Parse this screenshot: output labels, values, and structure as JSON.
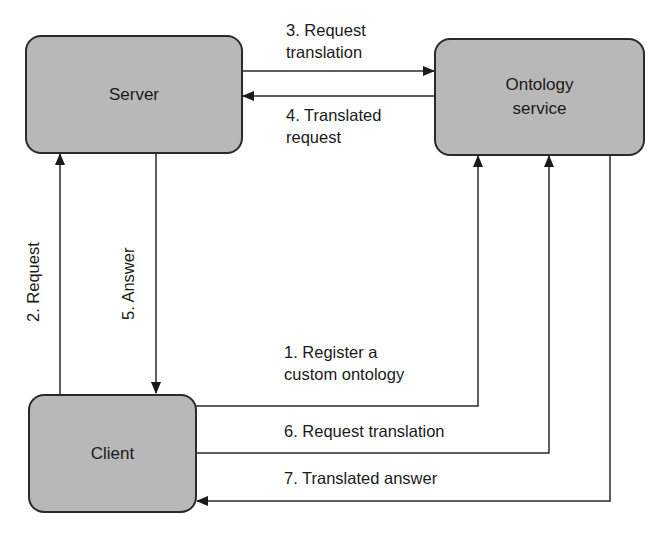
{
  "diagram": {
    "nodes": {
      "server": {
        "label": "Server"
      },
      "ontology": {
        "label_line1": "Ontology",
        "label_line2": "service"
      },
      "client": {
        "label": "Client"
      }
    },
    "edges": [
      {
        "id": "e1",
        "from": "client",
        "to": "ontology",
        "label_line1": "1. Register a",
        "label_line2": "custom ontology"
      },
      {
        "id": "e2",
        "from": "client",
        "to": "server",
        "label": "2. Request"
      },
      {
        "id": "e3",
        "from": "server",
        "to": "ontology",
        "label_line1": "3. Request",
        "label_line2": "translation"
      },
      {
        "id": "e4",
        "from": "ontology",
        "to": "server",
        "label_line1": "4. Translated",
        "label_line2": "request"
      },
      {
        "id": "e5",
        "from": "server",
        "to": "client",
        "label": "5. Answer"
      },
      {
        "id": "e6",
        "from": "client",
        "to": "ontology",
        "label": "6. Request translation"
      },
      {
        "id": "e7",
        "from": "ontology",
        "to": "client",
        "label": "7. Translated answer"
      }
    ],
    "colors": {
      "box_fill": "#b8b8b8",
      "stroke": "#2a2a2a",
      "background": "#ffffff"
    }
  }
}
